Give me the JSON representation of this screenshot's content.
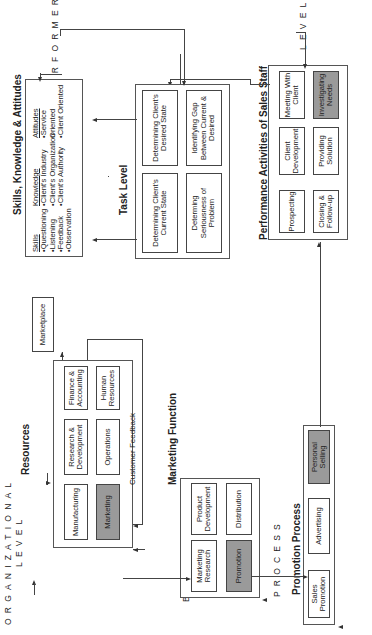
{
  "level_labels": {
    "organizational": "ORGANIZATIONAL",
    "business": "BUSINESS",
    "process": "PROCESS",
    "performer": "PERFORMER",
    "level": "LEVEL"
  },
  "resources": {
    "title": "Resources",
    "boxes": [
      "Manufacturing",
      "Research & Development",
      "Finance & Accounting",
      "Marketing",
      "Operations",
      "Human Resources"
    ],
    "highlighted": "Marketing"
  },
  "marketplace": {
    "label": "Marketplace"
  },
  "customer_feedback": {
    "label": "Customer Feedback"
  },
  "marketing_function": {
    "title": "Marketing Function",
    "boxes": [
      "Marketing Research",
      "Product Development",
      "Promotion",
      "Distribution"
    ],
    "highlighted": "Promotion"
  },
  "promotion_process": {
    "title": "Promotion Process",
    "boxes": [
      "Sales Promotion",
      "Advertising",
      "Personal Selling"
    ],
    "highlighted": "Personal Selling"
  },
  "sales_staff": {
    "title": "Performance Activities of Sales Staff",
    "boxes": [
      "Prospecting",
      "Client Development",
      "Meeting With Client",
      "Closing & Follow-up",
      "Providing Solution",
      "Investigating Needs"
    ],
    "highlighted": "Investigating Needs"
  },
  "task_level": {
    "title": "Task Level",
    "boxes": [
      "Determining Client's Current State",
      "Determining Client's Desired State",
      "Determing Seriousness of Problem",
      "Identifying Gap Between Current & Desired"
    ]
  },
  "ska": {
    "title": "Skills, Knowledge & Attitudes",
    "columns": [
      {
        "heading": "Skills",
        "items": [
          "•Questioning",
          "•Listening",
          "•Feedback",
          "•Observation"
        ]
      },
      {
        "heading": "Knowledge",
        "items": [
          "•Client's Industry",
          "•Client's Organization",
          "•Client's Authority"
        ]
      },
      {
        "heading": "Attitudes",
        "items": [
          "•Service Oriented",
          "•Client Oriented"
        ]
      }
    ]
  },
  "colors": {
    "highlight": "#9a9a9a",
    "line": "#444444"
  }
}
